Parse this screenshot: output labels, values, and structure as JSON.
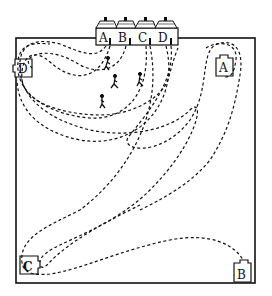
{
  "title": "",
  "houses": [
    {
      "label": "A",
      "x": 99
    },
    {
      "label": "B",
      "x": 117
    },
    {
      "label": "C",
      "x": 137
    },
    {
      "label": "D",
      "x": 157
    }
  ],
  "boxes": [
    {
      "label": "D",
      "x": 15,
      "y": 59,
      "w": 17,
      "h": 18
    },
    {
      "label": "A",
      "x": 216,
      "y": 56,
      "w": 17,
      "h": 20
    },
    {
      "label": "C",
      "x": 20,
      "y": 256,
      "w": 18,
      "h": 18
    },
    {
      "label": "B",
      "x": 234,
      "y": 262,
      "w": 17,
      "h": 20
    }
  ],
  "figures_count": 3,
  "colors": {
    "ink": "#111111",
    "background": "#ffffff"
  }
}
